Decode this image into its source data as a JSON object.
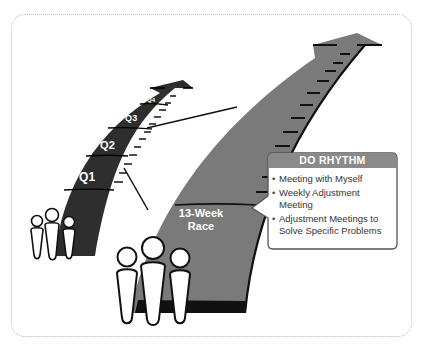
{
  "diagram": {
    "small_arrow": {
      "color": "#333333",
      "labels": [
        "Q1",
        "Q2",
        "Q3",
        "Q4"
      ]
    },
    "big_arrow": {
      "color": "#777777",
      "label_line1": "13-Week",
      "label_line2": "Race"
    },
    "callout": {
      "title": "DO RHYTHM",
      "header_color": "#8a8a8a",
      "items": [
        "Meeting with Myself",
        "Weekly Adjustment Meeting",
        "Adjustment Meetings to Solve Specific Problems"
      ]
    },
    "people_icons": [
      {
        "group": "small",
        "count": 3
      },
      {
        "group": "large",
        "count": 3
      }
    ]
  }
}
